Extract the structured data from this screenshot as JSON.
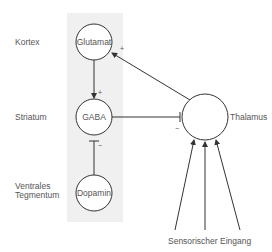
{
  "diagram": {
    "colors": {
      "panel": "#f0f0f0",
      "line": "#444444",
      "text": "#555555"
    },
    "region_labels": {
      "kortex": "Kortex",
      "striatum": "Striatum",
      "vta_line1": "Ventrales",
      "vta_line2": "Tegmentum"
    },
    "nodes": {
      "glutamat": "Glutamat",
      "gaba": "GABA",
      "dopamin": "Dopamin",
      "thalamus": "Thalamus"
    },
    "signs": {
      "glutamat_to_gaba": "+",
      "thalamus_to_glutamat": "+",
      "dopamin_to_gaba": "−",
      "gaba_to_thalamus": "−"
    },
    "input_label": "Sensorischer Eingang"
  }
}
